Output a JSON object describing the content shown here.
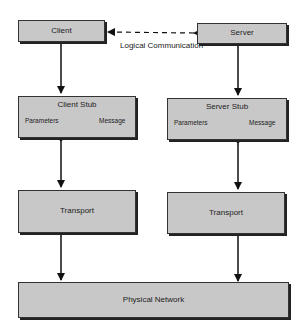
{
  "diagram": {
    "left_stack": {
      "client": "Client",
      "client_stub": {
        "title": "Client Stub",
        "left": "Parameters",
        "right": "Message"
      },
      "transport": "Transport"
    },
    "right_stack": {
      "server": "Server",
      "server_stub": {
        "title": "Server Stub",
        "left": "Parameters",
        "right": "Message"
      },
      "transport": "Transport"
    },
    "shared": {
      "physical_network": "Physical Network",
      "logical_link_label": "Logical Communication"
    },
    "colors": {
      "box_fill": "#c8c8c8",
      "border": "#333333",
      "arrow": "#111111"
    }
  }
}
